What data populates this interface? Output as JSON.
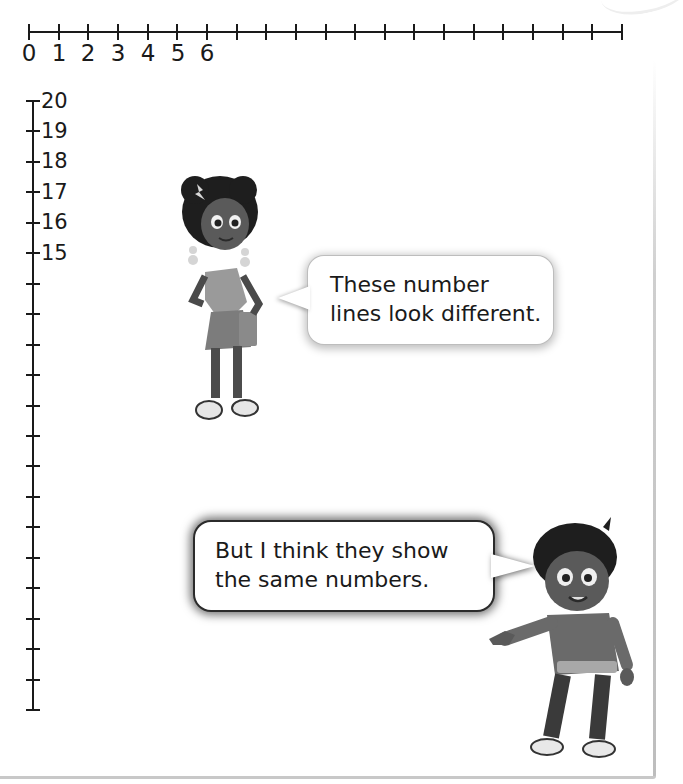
{
  "horizontal_number_line": {
    "start": 0,
    "end": 20,
    "tick_count": 21,
    "labels": [
      "0",
      "1",
      "2",
      "3",
      "4",
      "5",
      "6"
    ]
  },
  "vertical_number_line": {
    "start": 20,
    "end": 0,
    "tick_count": 21,
    "labels": [
      "20",
      "19",
      "18",
      "17",
      "16",
      "15"
    ]
  },
  "speech_bubbles": {
    "girl": {
      "line1": "These number",
      "line2": "lines look different."
    },
    "boy": {
      "line1": "But I think they show",
      "line2": "the same numbers."
    }
  },
  "characters": {
    "girl": "girl-character",
    "boy": "boy-character"
  },
  "colors": {
    "line": "#1a1a1a",
    "background": "#ffffff",
    "bubble_border": "#2b2b2b"
  }
}
